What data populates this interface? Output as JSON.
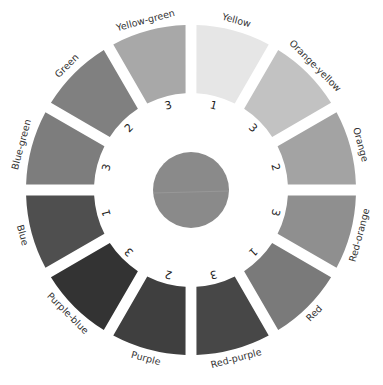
{
  "diagram": {
    "center_circle": {
      "color": "#8a8a8a",
      "name": "neutral-gray"
    },
    "segments": [
      {
        "label": "Yellow",
        "number": "1",
        "angle": 15,
        "color": "#e6e6e6"
      },
      {
        "label": "Orange-yellow",
        "number": "3",
        "angle": 45,
        "color": "#c2c2c2"
      },
      {
        "label": "Orange",
        "number": "2",
        "angle": 75,
        "color": "#a3a3a3"
      },
      {
        "label": "Red-orange",
        "number": "3",
        "angle": 105,
        "color": "#8f8f8f"
      },
      {
        "label": "Red",
        "number": "1",
        "angle": 135,
        "color": "#7a7a7a"
      },
      {
        "label": "Red-purple",
        "number": "3",
        "angle": 165,
        "color": "#474747"
      },
      {
        "label": "Purple",
        "number": "2",
        "angle": 195,
        "color": "#3f3f3f"
      },
      {
        "label": "Purple-blue",
        "number": "3",
        "angle": 225,
        "color": "#333333"
      },
      {
        "label": "Blue",
        "number": "1",
        "angle": 255,
        "color": "#4f4f4f"
      },
      {
        "label": "Blue-green",
        "number": "3",
        "angle": 285,
        "color": "#7d7d7d"
      },
      {
        "label": "Green",
        "number": "2",
        "angle": 315,
        "color": "#808080"
      },
      {
        "label": "Yellow-green",
        "number": "3",
        "angle": 345,
        "color": "#a8a8a8"
      }
    ]
  }
}
